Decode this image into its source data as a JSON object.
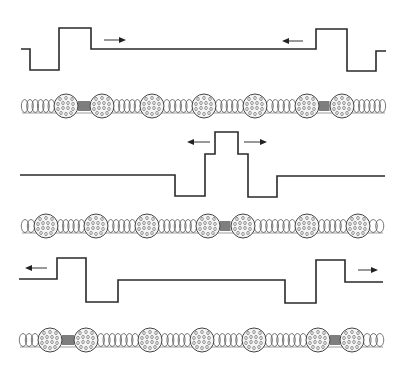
{
  "diagram": {
    "title": "",
    "colors": {
      "line": "#2a2a2a",
      "nucleosome_fill": "#f4f4f4",
      "compacted_linker": "#444444",
      "background": "#ffffff"
    },
    "panels": [
      {
        "id": "panel-1",
        "waveform": [
          [
            21,
            49
          ],
          [
            30,
            49
          ],
          [
            30,
            70
          ],
          [
            59,
            70
          ],
          [
            59,
            28
          ],
          [
            91,
            28
          ],
          [
            91,
            49
          ],
          [
            316,
            49
          ],
          [
            316,
            29
          ],
          [
            347,
            29
          ],
          [
            347,
            71
          ],
          [
            376,
            71
          ],
          [
            376,
            51
          ],
          [
            386,
            51
          ]
        ],
        "arrows": [
          {
            "direction": "right",
            "from": [
              104,
              40
            ],
            "to": [
              126,
              40
            ]
          },
          {
            "direction": "left",
            "from": [
              303,
              41
            ],
            "to": [
              282,
              41
            ]
          }
        ],
        "chromatin": {
          "y": 106,
          "x_start": 22,
          "x_end": 385,
          "nucleosomes": [
            66,
            102,
            152,
            204,
            255,
            307,
            342
          ],
          "compacted_linkers": [
            [
              66,
              102
            ],
            [
              307,
              342
            ]
          ]
        }
      },
      {
        "id": "panel-2",
        "waveform": [
          [
            20,
            175
          ],
          [
            175,
            175
          ],
          [
            175,
            196
          ],
          [
            205,
            196
          ],
          [
            205,
            154
          ],
          [
            215,
            154
          ],
          [
            215,
            132
          ],
          [
            238,
            132
          ],
          [
            238,
            154
          ],
          [
            248,
            154
          ],
          [
            248,
            197
          ],
          [
            277,
            197
          ],
          [
            277,
            176
          ],
          [
            385,
            176
          ]
        ],
        "arrows": [
          {
            "direction": "left",
            "from": [
              210,
              142
            ],
            "to": [
              187,
              142
            ]
          },
          {
            "direction": "right",
            "from": [
              244,
              142
            ],
            "to": [
              267,
              142
            ]
          }
        ],
        "chromatin": {
          "y": 226,
          "x_start": 22,
          "x_end": 383,
          "nucleosomes": [
            46,
            96,
            147,
            208,
            243,
            307,
            358
          ],
          "compacted_linkers": [
            [
              208,
              243
            ]
          ]
        }
      },
      {
        "id": "panel-3",
        "waveform": [
          [
            19,
            279
          ],
          [
            57,
            279
          ],
          [
            57,
            258
          ],
          [
            86,
            258
          ],
          [
            86,
            302
          ],
          [
            118,
            302
          ],
          [
            118,
            280
          ],
          [
            285,
            280
          ],
          [
            285,
            303
          ],
          [
            316,
            303
          ],
          [
            316,
            260
          ],
          [
            345,
            260
          ],
          [
            345,
            282
          ],
          [
            383,
            282
          ]
        ],
        "arrows": [
          {
            "direction": "left",
            "from": [
              47,
              268
            ],
            "to": [
              25,
              268
            ]
          },
          {
            "direction": "right",
            "from": [
              358,
              270
            ],
            "to": [
              378,
              270
            ]
          }
        ],
        "chromatin": {
          "y": 340,
          "x_start": 20,
          "x_end": 383,
          "nucleosomes": [
            50,
            86,
            150,
            202,
            254,
            318,
            352
          ],
          "compacted_linkers": [
            [
              50,
              86
            ],
            [
              318,
              352
            ]
          ]
        }
      }
    ],
    "icons": {
      "arrow": "arrow-icon",
      "nucleosome": "nucleosome-icon",
      "linker_coil": "coil-icon"
    }
  }
}
